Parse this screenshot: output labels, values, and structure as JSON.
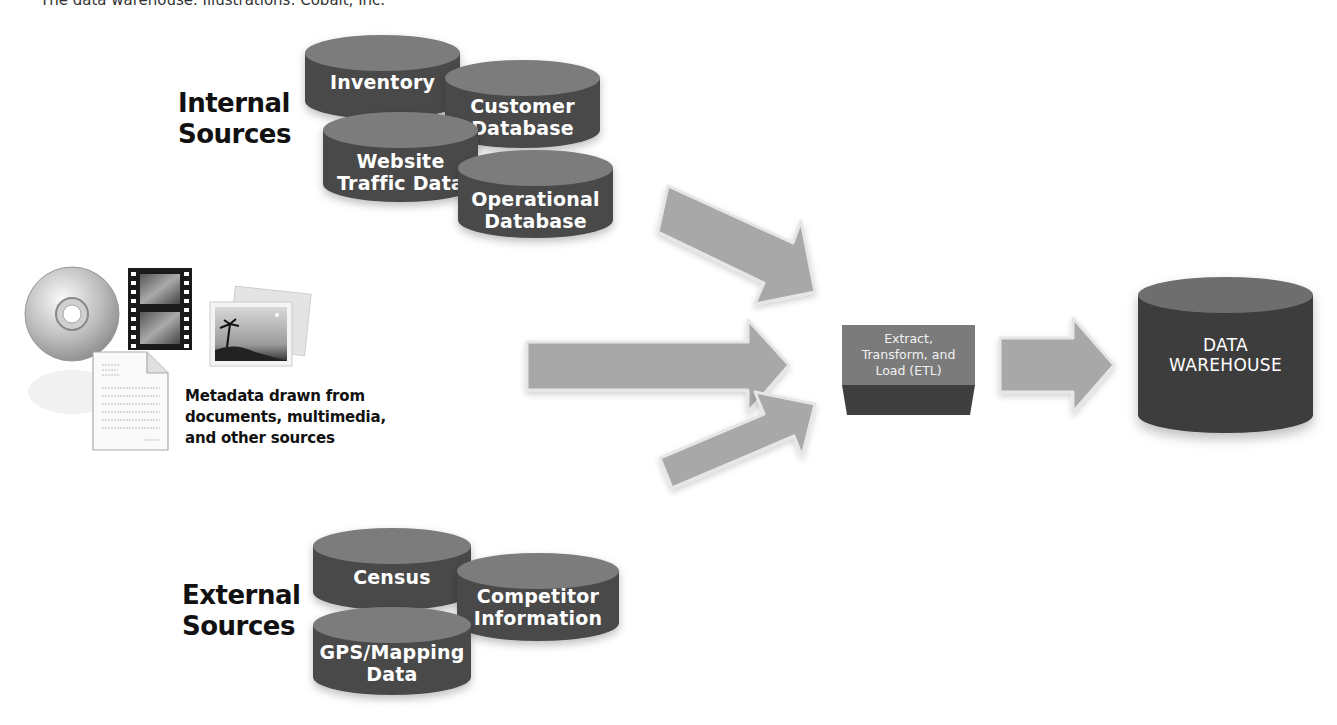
{
  "caption": "The data warehouse. Illustrations: Cobalt, Inc.",
  "colors": {
    "cylinder_top": "#7c7c7c",
    "cylinder_body": "#4a4a4a",
    "warehouse_body": "#3c3c3c",
    "arrow_fill": "#a8a8a8",
    "arrow_stroke": "#e6e6e6",
    "etl_top": "#7b7b7b",
    "etl_bottom": "#3f3f3f"
  },
  "internal": {
    "label_line1": "Internal",
    "label_line2": "Sources",
    "databases": [
      {
        "line1": "Inventory",
        "line2": ""
      },
      {
        "line1": "Customer",
        "line2": "Database"
      },
      {
        "line1": "Website",
        "line2": "Traffic Data"
      },
      {
        "line1": "Operational",
        "line2": "Database"
      }
    ]
  },
  "metadata": {
    "line1": "Metadata drawn from",
    "line2": "documents, multimedia,",
    "line3": "and other sources",
    "icons": [
      "cd-icon",
      "film-strip-icon",
      "document-icon",
      "photo-icon"
    ]
  },
  "external": {
    "label_line1": "External",
    "label_line2": "Sources",
    "databases": [
      {
        "line1": "Census",
        "line2": ""
      },
      {
        "line1": "Competitor",
        "line2": "Information"
      },
      {
        "line1": "GPS/Mapping",
        "line2": "Data"
      }
    ]
  },
  "etl": {
    "line1": "Extract,",
    "line2": "Transform, and",
    "line3": "Load (ETL)"
  },
  "warehouse": {
    "line1": "DATA",
    "line2": "WAREHOUSE"
  }
}
